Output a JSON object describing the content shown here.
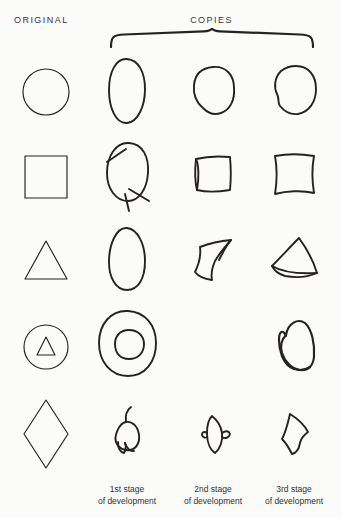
{
  "header": {
    "original_label": "ORIGINAL",
    "copies_label": "COPIES",
    "bracket_icon": "curly-brace-icon"
  },
  "footer": {
    "captions": [
      {
        "line1": "1st stage",
        "line2": "of development"
      },
      {
        "line1": "2nd stage",
        "line2": "of development"
      },
      {
        "line1": "3rd stage",
        "line2": "of development"
      }
    ]
  },
  "colors": {
    "paper": "#fbfbfa",
    "ink": "#26221f",
    "text": "#35312c"
  },
  "columns": [
    {
      "key": "original",
      "label": "ORIGINAL"
    },
    {
      "key": "stage1",
      "label": "1st stage of development"
    },
    {
      "key": "stage2",
      "label": "2nd stage of development"
    },
    {
      "key": "stage3",
      "label": "3rd stage of development"
    }
  ],
  "rows": [
    {
      "index": 1,
      "original_shape": "circle",
      "cells": [
        {
          "column": "original",
          "shape": "circle",
          "drawn": true,
          "description": "precise printed circle"
        },
        {
          "column": "stage1",
          "shape": "oval",
          "drawn": true,
          "description": "tall hand-drawn oval"
        },
        {
          "column": "stage2",
          "shape": "rounded-blob",
          "drawn": true,
          "description": "roughly circular blob"
        },
        {
          "column": "stage3",
          "shape": "rounded-blob",
          "drawn": true,
          "description": "near-circular blob with notch"
        }
      ]
    },
    {
      "index": 2,
      "original_shape": "square",
      "cells": [
        {
          "column": "original",
          "shape": "square",
          "drawn": true,
          "description": "precise printed square"
        },
        {
          "column": "stage1",
          "shape": "circle-with-crossings",
          "drawn": true,
          "description": "closed loop with overshooting crossed strokes"
        },
        {
          "column": "stage2",
          "shape": "wobbly-square",
          "drawn": true,
          "description": "small irregular square"
        },
        {
          "column": "stage3",
          "shape": "wobbly-square",
          "drawn": true,
          "description": "square with bowed sides"
        }
      ]
    },
    {
      "index": 3,
      "original_shape": "triangle",
      "cells": [
        {
          "column": "original",
          "shape": "triangle",
          "drawn": true,
          "description": "precise printed triangle"
        },
        {
          "column": "stage1",
          "shape": "egg",
          "drawn": true,
          "description": "egg-shaped closed loop"
        },
        {
          "column": "stage2",
          "shape": "leaf-diamond",
          "drawn": true,
          "description": "leaf-like form with one pointed corner"
        },
        {
          "column": "stage3",
          "shape": "rounded-triangle",
          "drawn": true,
          "description": "triangle with curved base"
        }
      ]
    },
    {
      "index": 4,
      "original_shape": "triangle-in-circle",
      "cells": [
        {
          "column": "original",
          "shape": "triangle-in-circle",
          "drawn": true,
          "description": "small triangle inscribed in a circle"
        },
        {
          "column": "stage1",
          "shape": "circle-in-blob",
          "drawn": true,
          "description": "round blob enclosing a small circle"
        },
        {
          "column": "stage2",
          "shape": "none",
          "drawn": false,
          "description": "no drawing produced"
        },
        {
          "column": "stage3",
          "shape": "looped-teardrop",
          "drawn": true,
          "description": "teardrop loop inside an outer curve"
        }
      ]
    },
    {
      "index": 5,
      "original_shape": "diamond",
      "cells": [
        {
          "column": "original",
          "shape": "diamond",
          "drawn": true,
          "description": "precise printed diamond / rhombus"
        },
        {
          "column": "stage1",
          "shape": "scribble-loop",
          "drawn": true,
          "description": "small knotted loop with tail"
        },
        {
          "column": "stage2",
          "shape": "double-lobe",
          "drawn": true,
          "description": "narrow two-lobed form"
        },
        {
          "column": "stage3",
          "shape": "angular-kite",
          "drawn": true,
          "description": "angular kite-like quadrilateral"
        }
      ]
    }
  ]
}
